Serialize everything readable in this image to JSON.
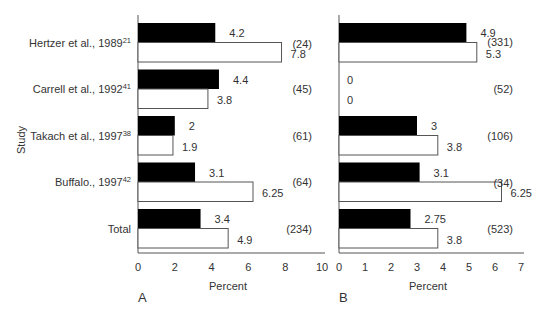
{
  "chart_data": [
    {
      "panel": "A",
      "type": "bar",
      "orientation": "horizontal",
      "categories": [
        "Hertzer et al., 1989",
        "Carrell et al., 1992",
        "Takach et al., 1997",
        "Buffalo., 1997",
        "Total"
      ],
      "category_superscripts": [
        "21",
        "41",
        "38",
        "42",
        ""
      ],
      "series": [
        {
          "name": "black",
          "color": "#000000",
          "values": [
            4.2,
            4.4,
            2,
            3.1,
            3.4
          ],
          "labels": [
            "4.2",
            "4.4",
            "2",
            "3.1",
            "3.4"
          ]
        },
        {
          "name": "white",
          "color": "#ffffff",
          "values": [
            7.8,
            3.8,
            1.9,
            6.25,
            4.9
          ],
          "labels": [
            "7.8",
            "3.8",
            "1.9",
            "6.25",
            "4.9"
          ]
        }
      ],
      "n_labels": [
        "(24)",
        "(45)",
        "(61)",
        "(64)",
        "(234)"
      ],
      "xlabel": "Percent",
      "ylabel": "Study",
      "xlim": [
        0,
        10
      ],
      "xticks": [
        0,
        2,
        4,
        6,
        8,
        10
      ],
      "panel_label": "A",
      "grid": false
    },
    {
      "panel": "B",
      "type": "bar",
      "orientation": "horizontal",
      "categories": [
        "Hertzer et al., 1989",
        "Carrell et al., 1992",
        "Takach et al., 1997",
        "Buffalo., 1997",
        "Total"
      ],
      "series": [
        {
          "name": "black",
          "color": "#000000",
          "values": [
            4.9,
            0,
            3,
            3.1,
            2.75
          ],
          "labels": [
            "4.9",
            "0",
            "3",
            "3.1",
            "2.75"
          ]
        },
        {
          "name": "white",
          "color": "#ffffff",
          "values": [
            5.3,
            0,
            3.8,
            6.25,
            3.8
          ],
          "labels": [
            "5.3",
            "0",
            "3.8",
            "6.25",
            "3.8"
          ]
        }
      ],
      "n_labels": [
        "(331)",
        "(52)",
        "(106)",
        "(34)",
        "(523)"
      ],
      "xlabel": "Percent",
      "xlim": [
        0,
        7
      ],
      "xticks": [
        0,
        1,
        2,
        3,
        4,
        5,
        6,
        7
      ],
      "panel_label": "B",
      "grid": false
    }
  ]
}
